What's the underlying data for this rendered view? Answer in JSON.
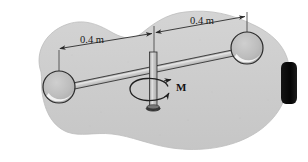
{
  "figure": {
    "background_color": "#ffffff",
    "blob": {
      "name": "ground-region-blob",
      "fill": "#cfcfcf",
      "stroke": "#b5b5b5"
    },
    "labels": {
      "dim_left": "0.4 m",
      "dim_right": "0.4 m",
      "moment": "M"
    },
    "colors": {
      "sphere_fill": "#b9b9b9",
      "sphere_stroke": "#2b2b2b",
      "sphere_highlight": "#f2f2f2",
      "rod_fill": "#c6c6c6",
      "rod_stroke": "#2b2b2b",
      "shaft_fill": "#b9b9b9",
      "shaft_stroke": "#2b2b2b",
      "shaft_base": "#3a3a3a",
      "dimension_line": "#2b2b2b",
      "black_block": "#0b0b0b",
      "text": "#1a1a1a"
    },
    "geometry": {
      "sphere_left": {
        "cx": 59,
        "cy": 87,
        "r": 16
      },
      "sphere_right": {
        "cx": 247,
        "cy": 48,
        "r": 16
      },
      "shaft": {
        "x": 153,
        "y_top": 52,
        "y_bottom": 110,
        "width": 7
      },
      "rod_angle_deg": -11.7,
      "rotation_arrow": {
        "cx": 153,
        "cy": 91,
        "rx": 18,
        "ry": 11
      }
    }
  }
}
